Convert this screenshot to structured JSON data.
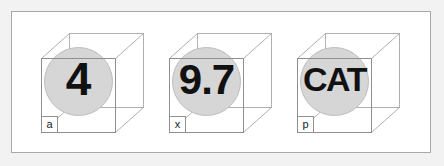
{
  "figure": {
    "background_color": "#f2f2f2",
    "plate_color": "#ffffff",
    "frame_border_color": "#a8a8a8",
    "cube_edge_color": "#8f8f8f",
    "cube_hidden_edge_color": "#b0b0b0",
    "sphere_fill_color": "#d6d6d6",
    "sphere_stroke_color": "#bdbdbd",
    "value_text_color": "#111111",
    "label_text_color": "#1a1a1a"
  },
  "panels": [
    {
      "id": "panel-a",
      "label": "a",
      "value": "4",
      "value_class": "v-4",
      "icon": "cube-with-sphere-icon"
    },
    {
      "id": "panel-x",
      "label": "x",
      "value": "9.7",
      "value_class": "v-97",
      "icon": "cube-with-sphere-icon"
    },
    {
      "id": "panel-p",
      "label": "p",
      "value": "CAT",
      "value_class": "v-cat",
      "icon": "cube-with-sphere-icon"
    }
  ]
}
